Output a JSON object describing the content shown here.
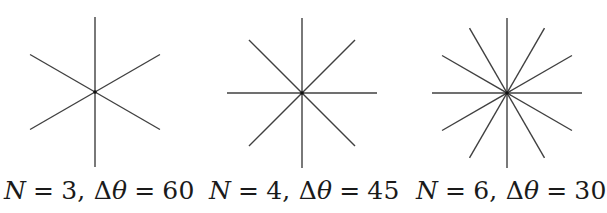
{
  "figure": {
    "stroke_color": "#404040",
    "stars": [
      {
        "n": 3,
        "delta_theta": 60,
        "cx": 95,
        "cy": 92,
        "r": 75,
        "label_n": "3",
        "label_dt": "60",
        "label_x": 4
      },
      {
        "n": 4,
        "delta_theta": 45,
        "cx": 302,
        "cy": 93,
        "r": 75,
        "label_n": "4",
        "label_dt": "45",
        "label_x": 209
      },
      {
        "n": 6,
        "delta_theta": 30,
        "cx": 507,
        "cy": 93,
        "r": 75,
        "label_n": "6",
        "label_dt": "30",
        "label_x": 416
      }
    ]
  },
  "labels": {
    "n_symbol": "N",
    "eq": "=",
    "comma": ",",
    "delta": "Δ",
    "theta": "θ"
  }
}
